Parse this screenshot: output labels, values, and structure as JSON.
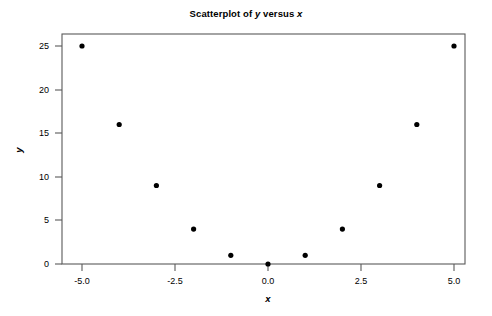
{
  "chart_data": {
    "type": "scatter",
    "title": "Scatterplot of y versus x",
    "title_prefix": "Scatterplot of ",
    "title_var_y": "y",
    "title_middle": " versus ",
    "title_var_x": "x",
    "xlabel": "x",
    "ylabel": "y",
    "xlim": [
      -5.6,
      5.6
    ],
    "ylim": [
      -1.5,
      26.5
    ],
    "grid": false,
    "legend": false,
    "marker": "filled-circle",
    "marker_color": "#000000",
    "frame_color": "#5a5a5a",
    "x": [
      -5,
      -4,
      -3,
      -2,
      -1,
      0,
      1,
      2,
      3,
      4,
      5
    ],
    "y": [
      25,
      16,
      9,
      4,
      1,
      0,
      1,
      4,
      9,
      16,
      25
    ],
    "points": [
      {
        "x": -5,
        "y": 25
      },
      {
        "x": -4,
        "y": 16
      },
      {
        "x": -3,
        "y": 9
      },
      {
        "x": -2,
        "y": 4
      },
      {
        "x": -1,
        "y": 1
      },
      {
        "x": 0,
        "y": 0
      },
      {
        "x": 1,
        "y": 1
      },
      {
        "x": 2,
        "y": 4
      },
      {
        "x": 3,
        "y": 9
      },
      {
        "x": 4,
        "y": 16
      },
      {
        "x": 5,
        "y": 25
      }
    ],
    "xticks": [
      -5.0,
      -2.5,
      0.0,
      2.5,
      5.0
    ],
    "xticklabels": [
      "-5.0",
      "-2.5",
      "0.0",
      "2.5",
      "5.0"
    ],
    "yticks": [
      0,
      5,
      10,
      15,
      20,
      25
    ],
    "yticklabels": [
      "0",
      "5",
      "10",
      "15",
      "20",
      "25"
    ]
  }
}
